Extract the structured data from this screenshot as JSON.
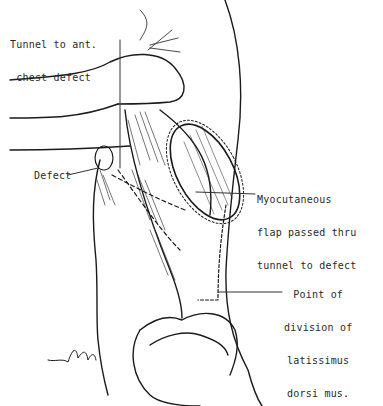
{
  "figure": {
    "type": "surgical illustration",
    "labels": {
      "tunnel": [
        "Tunnel to ant.",
        "chest defect"
      ],
      "defect": "Defect",
      "flap": [
        "Myocutaneous",
        "flap passed thru",
        "tunnel to defect"
      ],
      "division": [
        "Point of",
        "division of",
        "latissimus",
        "dorsi mus."
      ]
    },
    "signature": "Wolff"
  },
  "colors": {
    "ink": "#1a1a1a",
    "background": "#ffffff"
  }
}
